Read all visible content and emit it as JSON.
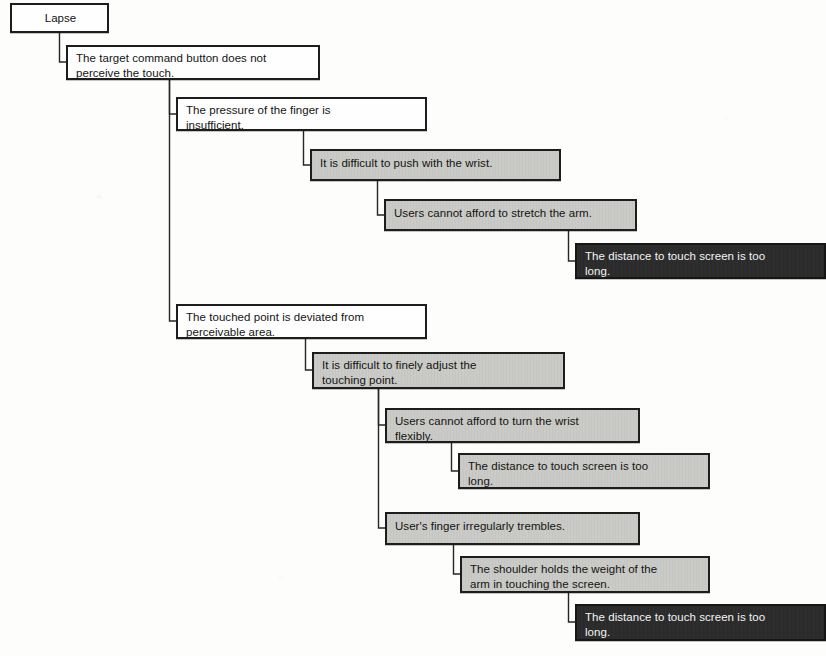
{
  "diagram": {
    "type": "root-cause-analysis-tree",
    "title": "Lapse",
    "palette": {
      "white_fill": "#fefefe",
      "gray_fill": "#c3c3c0",
      "dark_fill": "#2b2b2b",
      "dark_text": "#f4f4f4",
      "border": "#1d1d1d",
      "page": "#fdfdfc"
    },
    "nodes": [
      {
        "id": "n1",
        "level": 0,
        "fill": "white",
        "align": "center",
        "text": "Lapse"
      },
      {
        "id": "n2",
        "level": 1,
        "fill": "white",
        "align": "left",
        "text": "The target command button does not\nperceive the touch."
      },
      {
        "id": "n3",
        "level": 2,
        "fill": "white",
        "align": "left",
        "text": "The pressure of the finger is\ninsufficient."
      },
      {
        "id": "n4",
        "level": 3,
        "fill": "gray",
        "align": "left",
        "text": "It is difficult to push with the wrist."
      },
      {
        "id": "n5",
        "level": 4,
        "fill": "gray",
        "align": "left",
        "text": "Users cannot afford to stretch the arm."
      },
      {
        "id": "n6",
        "level": 5,
        "fill": "dark",
        "align": "left",
        "text": "The distance to touch screen is too\nlong."
      },
      {
        "id": "n7",
        "level": 2,
        "fill": "white",
        "align": "left",
        "text": "The touched point is deviated from\nperceivable area."
      },
      {
        "id": "n8",
        "level": 3,
        "fill": "gray",
        "align": "left",
        "text": "It is difficult  to  finely adjust the\ntouching point."
      },
      {
        "id": "n9",
        "level": 4,
        "fill": "gray",
        "align": "left",
        "text": "Users cannot afford to turn the  wrist\nflexibly."
      },
      {
        "id": "n10",
        "level": 5,
        "fill": "gray",
        "align": "left",
        "text": "The distance to touch  screen is too\nlong."
      },
      {
        "id": "n11",
        "level": 4,
        "fill": "gray",
        "align": "left",
        "text": "User's finger irregularly trembles."
      },
      {
        "id": "n12",
        "level": 5,
        "fill": "gray",
        "align": "left",
        "text": "The shoulder holds the  weight of the\narm in touching the screen."
      },
      {
        "id": "n13",
        "level": 6,
        "fill": "dark",
        "align": "left",
        "text": "The distance to touch  screen is too\nlong."
      }
    ],
    "edges": [
      {
        "from": "n1",
        "to": "n2"
      },
      {
        "from": "n2",
        "to": "n3"
      },
      {
        "from": "n3",
        "to": "n4"
      },
      {
        "from": "n4",
        "to": "n5"
      },
      {
        "from": "n5",
        "to": "n6"
      },
      {
        "from": "n2",
        "to": "n7"
      },
      {
        "from": "n7",
        "to": "n8"
      },
      {
        "from": "n8",
        "to": "n9"
      },
      {
        "from": "n9",
        "to": "n10"
      },
      {
        "from": "n8",
        "to": "n11"
      },
      {
        "from": "n11",
        "to": "n12"
      },
      {
        "from": "n12",
        "to": "n13"
      }
    ],
    "caption": ""
  },
  "layout": {
    "n1": {
      "x": 10,
      "y": 3,
      "w": 99,
      "h": 30
    },
    "n2": {
      "x": 66,
      "y": 45,
      "w": 254,
      "h": 35
    },
    "n3": {
      "x": 176,
      "y": 97,
      "w": 251,
      "h": 34
    },
    "n4": {
      "x": 310,
      "y": 149,
      "w": 251,
      "h": 32
    },
    "n5": {
      "x": 384,
      "y": 199,
      "w": 253,
      "h": 32
    },
    "n6": {
      "x": 575,
      "y": 243,
      "w": 251,
      "h": 36
    },
    "n7": {
      "x": 176,
      "y": 304,
      "w": 251,
      "h": 35
    },
    "n8": {
      "x": 312,
      "y": 352,
      "w": 253,
      "h": 37
    },
    "n9": {
      "x": 385,
      "y": 408,
      "w": 255,
      "h": 35
    },
    "n10": {
      "x": 458,
      "y": 453,
      "w": 252,
      "h": 36
    },
    "n11": {
      "x": 385,
      "y": 512,
      "w": 255,
      "h": 33
    },
    "n12": {
      "x": 460,
      "y": 556,
      "w": 250,
      "h": 37
    },
    "n13": {
      "x": 575,
      "y": 604,
      "w": 251,
      "h": 37
    },
    "edge_paths": [
      "M 59.5 33 L 59.5 62 L 66 62",
      "M 169.5 80 L 169.5 114 L 176 114",
      "M 303.5 131 L 303.5 165 L 310 165",
      "M 377.5 181 L 377.5 215 L 384 215",
      "M 568.5 231 L 568.5 261 L 575 261",
      "M 169.5 80 L 169.5 321 L 176 321",
      "M 305.5 339 L 305.5 370 L 312 370",
      "M 378.5 389 L 378.5 425 L 385 425",
      "M 451.5 443 L 451.5 471 L 458 471",
      "M 378.5 389 L 378.5 528 L 385 528",
      "M 453.5 545 L 453.5 574 L 460 574",
      "M 568.5 593 L 568.5 622 L 575 622"
    ]
  }
}
